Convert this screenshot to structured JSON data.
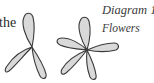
{
  "document": {
    "body_text_fragment": "the"
  },
  "figure": {
    "caption_title": "Diagram 1",
    "caption_subtitle": "Flowers",
    "petal_fill": "#d9d9d9",
    "petal_stroke": "#3a3a3a",
    "flowers": [
      {
        "name": "three-petal-flower",
        "petal_count": 3
      },
      {
        "name": "five-petal-flower",
        "petal_count": 5
      }
    ]
  }
}
